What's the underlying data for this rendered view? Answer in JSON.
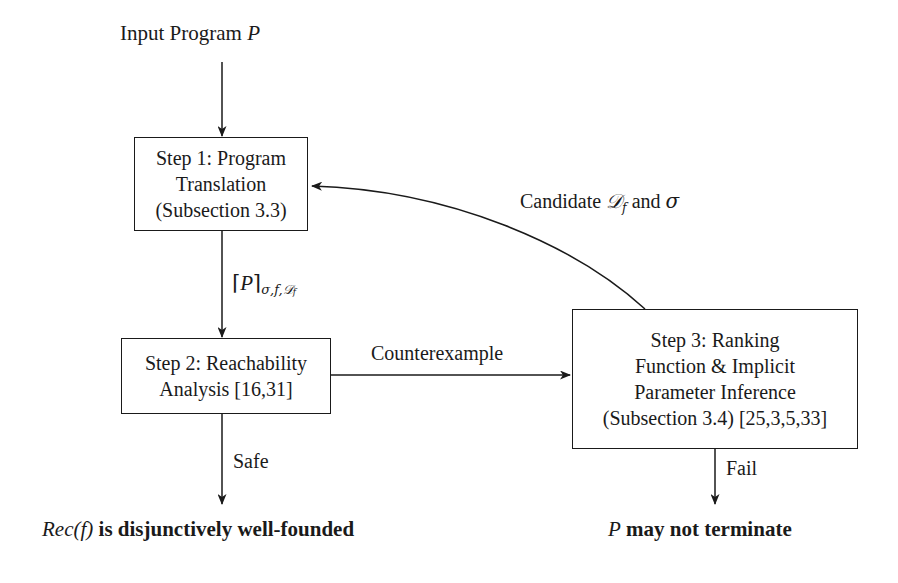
{
  "figure": {
    "type": "flowchart",
    "title_text": "Input Program P",
    "background": "#ffffff",
    "stroke_color": "#1a1a1a"
  },
  "entry": {
    "label_plain": "Input Program",
    "label_var": "P"
  },
  "nodes": [
    {
      "id": "step1",
      "name": "step-1-program-translation",
      "lines": [
        "Step 1: Program",
        "Translation",
        "(Subsection 3.3)"
      ]
    },
    {
      "id": "step2",
      "name": "step-2-reachability-analysis",
      "lines": [
        "Step 2: Reachability",
        "Analysis [16,31]"
      ]
    },
    {
      "id": "step3",
      "name": "step-3-ranking-function-parameter-inference",
      "lines": [
        "Step 3: Ranking",
        "Function & Implicit",
        "Parameter Inference",
        "(Subsection 3.4) [25,3,5,33]"
      ]
    }
  ],
  "edges": {
    "entry_to_step1": {
      "label": ""
    },
    "step1_to_step2": {
      "label_prefix": "⌈",
      "label_var": "P",
      "label_suffix": "⌉",
      "label_sub": "σ,f,𝒟",
      "label_sub_sub": "f"
    },
    "step2_to_step3": {
      "label": "Counterexample"
    },
    "step3_to_step1": {
      "label_prefix": "Candidate",
      "label_symbol": "𝒟",
      "label_symbol_sub": "f",
      "label_mid": "and",
      "label_sigma": "σ"
    },
    "step2_to_result": {
      "label": "Safe"
    },
    "step3_to_result": {
      "label": "Fail"
    }
  },
  "results": [
    {
      "id": "result-safe",
      "name": "result-rec-f-disjunctively-well-founded",
      "math_prefix": "Rec",
      "math_open": "(",
      "math_var": "f",
      "math_close": ")",
      "bold_text": "is disjunctively well-founded"
    },
    {
      "id": "result-fail",
      "name": "result-p-may-not-terminate",
      "math_var": "P",
      "bold_text": "may not terminate"
    }
  ]
}
